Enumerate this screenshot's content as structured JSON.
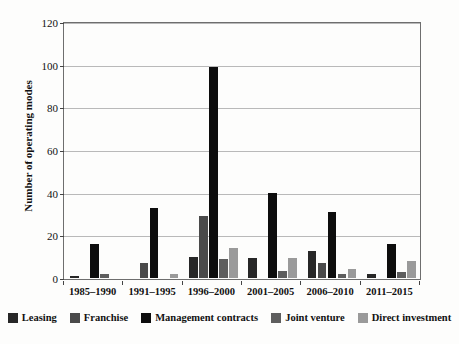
{
  "chart_data": {
    "type": "bar",
    "title": "",
    "xlabel": "",
    "ylabel": "Number of operating modes",
    "ylim": [
      0,
      120
    ],
    "yticks": [
      0,
      20,
      40,
      60,
      80,
      100,
      120
    ],
    "grid": true,
    "legend_position": "bottom",
    "categories": [
      "1985–1990",
      "1991–1995",
      "1996–2000",
      "2001–2005",
      "2006–2010",
      "2011–2015"
    ],
    "series": [
      {
        "name": "Leasing",
        "color": "#272727",
        "values": [
          1,
          0,
          10,
          9.5,
          12.5,
          2
        ]
      },
      {
        "name": "Franchise",
        "color": "#4a4a4a",
        "values": [
          0,
          7,
          29,
          0,
          7,
          0
        ]
      },
      {
        "name": "Management contracts",
        "color": "#0d0d0d",
        "values": [
          16,
          33,
          99,
          40,
          31,
          16
        ]
      },
      {
        "name": "Joint venture",
        "color": "#5e5e5e",
        "values": [
          2,
          0,
          9,
          3.5,
          2,
          3
        ]
      },
      {
        "name": "Direct investment",
        "color": "#9a9a9a",
        "values": [
          0,
          2,
          14,
          9.5,
          4,
          8
        ]
      }
    ]
  },
  "axes": {
    "ytick_labels": [
      "0",
      "20",
      "40",
      "60",
      "80",
      "100",
      "120"
    ]
  },
  "colors": {
    "plot_border": "#6e6e6e",
    "gridline": "#b9b9b9",
    "text": "#111111",
    "background": "#fdfdfc"
  }
}
